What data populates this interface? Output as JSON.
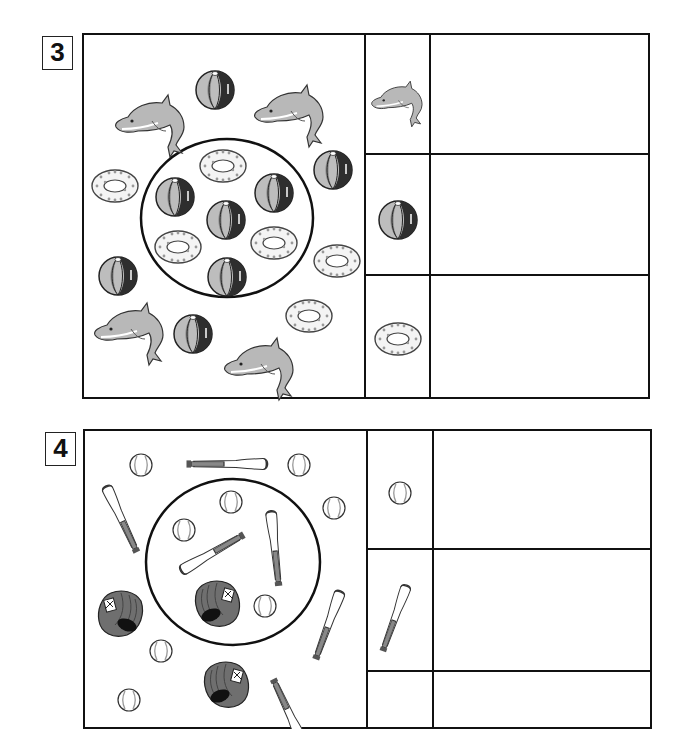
{
  "worksheet": {
    "problems": [
      {
        "number": "3",
        "theme": "pool toys",
        "categories": [
          {
            "icon": "dolphin-icon",
            "name": "dolphin",
            "answer": ""
          },
          {
            "icon": "beach-ball-icon",
            "name": "beach ball",
            "answer": ""
          },
          {
            "icon": "swim-ring-icon",
            "name": "swim ring",
            "answer": ""
          }
        ],
        "inside_circle": {
          "dolphin": 0,
          "beach ball": 4,
          "swim ring": 3
        },
        "outside_circle": {
          "dolphin": 4,
          "beach ball": 4,
          "swim ring": 3
        }
      },
      {
        "number": "4",
        "theme": "baseball",
        "categories": [
          {
            "icon": "baseball-icon",
            "name": "baseball",
            "answer": ""
          },
          {
            "icon": "baseball-bat-icon",
            "name": "bat",
            "answer": ""
          },
          {
            "icon": "glove-icon",
            "name": "glove",
            "answer": ""
          }
        ]
      }
    ]
  },
  "colors": {
    "line": "#111111",
    "ball_light": "#bdbdbd",
    "ball_mid": "#8a8a8a",
    "ball_dark": "#2e2e2e",
    "dolphin": "#b5b5b5",
    "glove": "#6f6f6f"
  }
}
